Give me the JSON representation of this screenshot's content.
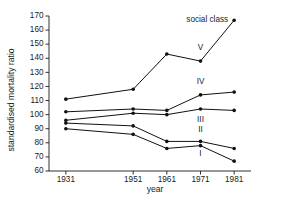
{
  "chart_data": {
    "type": "line",
    "title": "",
    "xlabel": "year",
    "ylabel": "standardised mortality ratio",
    "x": [
      1931,
      1951,
      1961,
      1971,
      1981
    ],
    "xtick_labels": [
      "1931",
      "1951",
      "1961",
      "1971",
      "1981"
    ],
    "xlim": [
      1926,
      1986
    ],
    "ylim": [
      60,
      170
    ],
    "ytick_labels": [
      "60",
      "70",
      "80",
      "90",
      "100",
      "110",
      "120",
      "130",
      "140",
      "150",
      "160",
      "170"
    ],
    "ytick_values": [
      60,
      70,
      80,
      90,
      100,
      110,
      120,
      130,
      140,
      150,
      160,
      170
    ],
    "grid": false,
    "legend": "inline-series-labels",
    "annotations": [
      {
        "text": "social class",
        "x": 1973,
        "y": 166
      }
    ],
    "series": [
      {
        "name": "V",
        "label": "V",
        "values": [
          111,
          118,
          143,
          138,
          167
        ],
        "label_x": 1971,
        "label_y": 146
      },
      {
        "name": "IV",
        "label": "IV",
        "values": [
          102,
          104,
          103,
          114,
          116
        ],
        "label_x": 1971,
        "label_y": 122
      },
      {
        "name": "III",
        "label": "III",
        "values": [
          96,
          101,
          100,
          104,
          103
        ],
        "label_x": 1971,
        "label_y": 95
      },
      {
        "name": "II",
        "label": "II",
        "values": [
          94,
          92,
          81,
          81,
          76
        ],
        "label_x": 1971,
        "label_y": 88
      },
      {
        "name": "I",
        "label": "I",
        "values": [
          90,
          86,
          76,
          78,
          67
        ],
        "label_x": 1971,
        "label_y": 71
      }
    ]
  }
}
